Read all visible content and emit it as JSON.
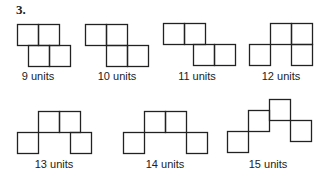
{
  "problem_number": "3.",
  "square_size": 21,
  "stroke_color": "#222222",
  "figures": [
    {
      "label": "9 units",
      "label_pos": [
        38,
        78
      ],
      "squares": [
        [
          17,
          24
        ],
        [
          38,
          24
        ],
        [
          28,
          45
        ],
        [
          49,
          45
        ]
      ]
    },
    {
      "label": "10 units",
      "label_pos": [
        117,
        78
      ],
      "squares": [
        [
          85,
          24
        ],
        [
          106,
          24
        ],
        [
          106,
          45
        ],
        [
          127,
          45
        ]
      ]
    },
    {
      "label": "11 units",
      "label_pos": [
        197,
        78
      ],
      "squares": [
        [
          163,
          23
        ],
        [
          184,
          23
        ],
        [
          193,
          44
        ],
        [
          214,
          44
        ]
      ]
    },
    {
      "label": "12 units",
      "label_pos": [
        281,
        78
      ],
      "squares": [
        [
          270,
          23
        ],
        [
          291,
          23
        ],
        [
          249,
          44
        ],
        [
          291,
          44
        ]
      ]
    },
    {
      "label": "13 units",
      "label_pos": [
        54,
        166
      ],
      "squares": [
        [
          38,
          111
        ],
        [
          59,
          111
        ],
        [
          17,
          132
        ],
        [
          70,
          132
        ]
      ]
    },
    {
      "label": "14 units",
      "label_pos": [
        165,
        166
      ],
      "squares": [
        [
          144,
          111
        ],
        [
          165,
          111
        ],
        [
          123,
          132
        ],
        [
          186,
          132
        ]
      ]
    },
    {
      "label": "15 units",
      "label_pos": [
        268,
        166
      ],
      "squares": [
        [
          227,
          131
        ],
        [
          248,
          110
        ],
        [
          269,
          99
        ],
        [
          290,
          120
        ]
      ]
    }
  ]
}
